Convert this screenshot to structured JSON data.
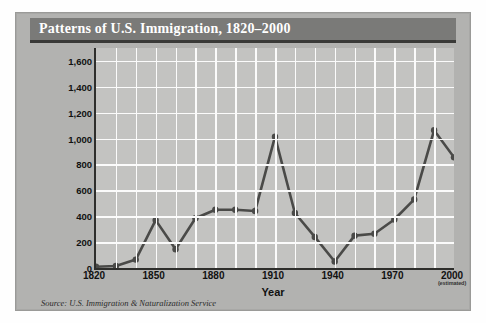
{
  "figure": {
    "title": "Patterns of U.S. Immigration, 1820–2000",
    "source": "Source: U.S. Immigration & Naturalization Service",
    "estimated_note": "(estimated)"
  },
  "chart_data": {
    "type": "line",
    "title": "Patterns of U.S. Immigration, 1820–2000",
    "xlabel": "Year",
    "ylabel": "Number of Immigrants (in thousands)",
    "x": [
      1820,
      1830,
      1840,
      1850,
      1860,
      1870,
      1880,
      1890,
      1900,
      1910,
      1920,
      1930,
      1940,
      1950,
      1960,
      1970,
      1980,
      1990,
      2000
    ],
    "values": [
      10,
      15,
      65,
      370,
      145,
      385,
      450,
      450,
      440,
      1015,
      425,
      240,
      50,
      250,
      265,
      375,
      530,
      1065,
      855
    ],
    "xlim": [
      1820,
      2000
    ],
    "ylim": [
      0,
      1700
    ],
    "xticks": [
      1820,
      1850,
      1880,
      1910,
      1940,
      1970,
      2000
    ],
    "xtick_labels": [
      "1820",
      "1850",
      "1880",
      "1910",
      "1940",
      "1970",
      "2000"
    ],
    "yticks": [
      0,
      200,
      400,
      600,
      800,
      1000,
      1200,
      1400,
      1600
    ],
    "ytick_labels": [
      "0",
      "200",
      "400",
      "600",
      "800",
      "1,000",
      "1,200",
      "1,400",
      "1,600"
    ],
    "grid": true,
    "legend": "none",
    "series_color": "#4a4a48",
    "marker": "circle",
    "annotations": [
      "2000 value is estimated"
    ]
  },
  "colors": {
    "card_background": "#b2b2b0",
    "title_bar": "#7a7a78",
    "title_text": "#ffffff",
    "plot_background": "#c3c3c1",
    "gridline": "#fbfbfb",
    "axis": "#2e2e2c",
    "line": "#4a4a48"
  }
}
